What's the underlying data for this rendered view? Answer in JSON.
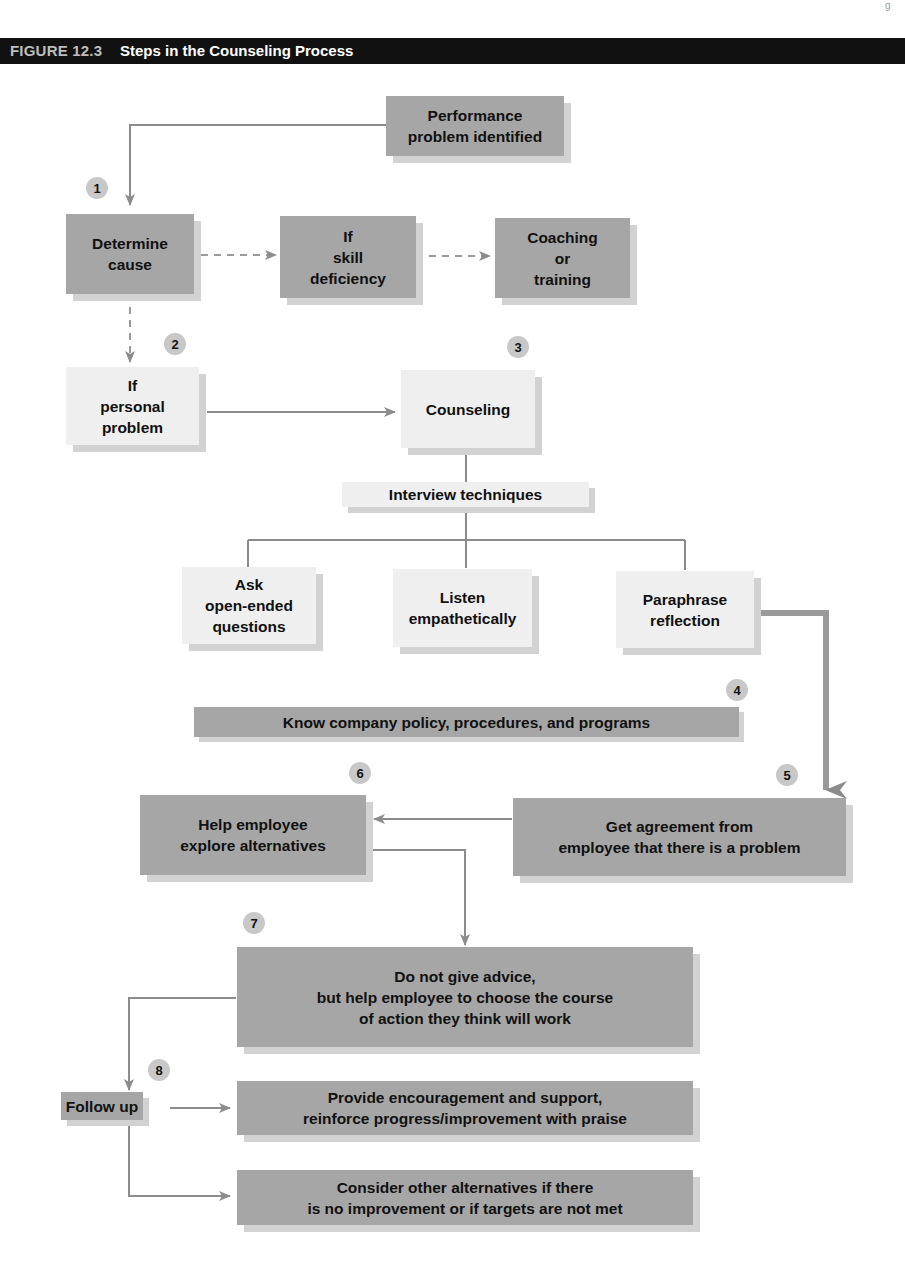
{
  "figure": {
    "number": "FIGURE 12.3",
    "title": "Steps in the Counseling Process"
  },
  "nodes": {
    "performance_problem": "Performance\nproblem identified",
    "determine_cause": "Determine\ncause",
    "skill_deficiency": "If\nskill\ndeficiency",
    "coaching_training": "Coaching\nor\ntraining",
    "personal_problem": "If\npersonal\nproblem",
    "counseling": "Counseling",
    "interview_techniques": "Interview techniques",
    "ask_questions": "Ask\nopen-ended\nquestions",
    "listen": "Listen\nempathetically",
    "paraphrase": "Paraphrase\nreflection",
    "know_policy": "Know company policy, procedures, and programs",
    "explore_alternatives": "Help employee\nexplore alternatives",
    "get_agreement": "Get agreement from\nemployee that there is a problem",
    "no_advice": "Do not give advice,\nbut help employee to choose the course\nof action they think will work",
    "follow_up": "Follow up",
    "encouragement": "Provide encouragement and support,\nreinforce progress/improvement with praise",
    "other_alternatives": "Consider other alternatives if there\nis no improvement or if targets are not met"
  },
  "steps": [
    "1",
    "2",
    "3",
    "4",
    "5",
    "6",
    "7",
    "8"
  ],
  "colors": {
    "dark_box": "#a6a6a6",
    "light_box": "#efefef",
    "shadow": "#d2d2d2",
    "connector": "#8c8c8c",
    "badge": "#c8c8c8",
    "title_bar": "#111111"
  }
}
